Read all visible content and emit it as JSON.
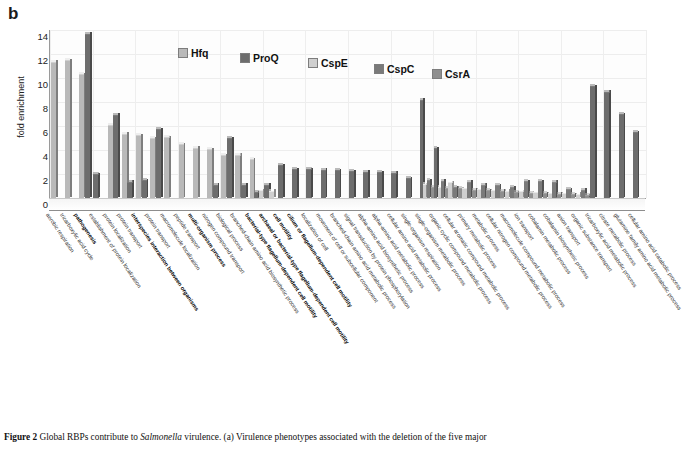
{
  "panel": {
    "letter": "b"
  },
  "legend": {
    "items": [
      {
        "label": "Hfq",
        "color": "#b9b9b9"
      },
      {
        "label": "ProQ",
        "color": "#6d6d6d"
      },
      {
        "label": "CspE",
        "color": "#cfcfcf"
      },
      {
        "label": "CspC",
        "color": "#7a7a7a"
      },
      {
        "label": "CsrA",
        "color": "#8f8f8f"
      }
    ]
  },
  "caption": {
    "figure_number": "Figure 2",
    "text_before_italic": "Global RBPs contribute to ",
    "italic": "Salmonella",
    "text_after_italic": " virulence. (a) Virulence phenotypes associated with the deletion of the five major"
  },
  "chart_data": {
    "type": "bar",
    "title": "",
    "xlabel": "",
    "ylabel": "fold enrichment",
    "ylim": [
      0,
      14
    ],
    "yticks": [
      0,
      2,
      4,
      6,
      8,
      10,
      12,
      14
    ],
    "grid": true,
    "legend_position": "top-center",
    "series_names": [
      "Hfq",
      "ProQ",
      "CspE",
      "CspC",
      "CsrA"
    ],
    "categories": [
      "aerobic respiration",
      "tricarboxylic acid cycle",
      "pathogenesis",
      "establishment of protein localization",
      "protein localization",
      "protein transport",
      "interspecies interaction between organisms",
      "protein transport",
      "macromolecule localization",
      "peptide transport",
      "multi-organism process",
      "nitrogen compound transport",
      "biological process",
      "branched-chain amino acid biosynthetic process",
      "bacterial-type flagellum-dependent cell motility",
      "archaeal or bacterial-type flagellum-dependent cell motility",
      "cell motility",
      "cilium or flagellum-dependent cell motility",
      "localization of cell",
      "movement of cell or subcellular component",
      "branched-chain amino acid metabolic process",
      "signal transduction by protein phosphorylation",
      "alpha-amino acid biosynthetic process",
      "alpha-amino acid metabolic process",
      "cellular amino acid metabolic process",
      "single-organism respiration",
      "single-organism metabolic process",
      "organic cyclic compound metabolic process",
      "cellular aromatic compound metabolic process",
      "primary metabolic process",
      "metabolic process",
      "cellular nitrogen compound metabolic process",
      "macromolecule compound metabolic process",
      "ion transport",
      "cobalamin metabolic process",
      "cobalamin biosynthetic process",
      "anion transport",
      "organic substance transport",
      "tricarboxylic acid metabolic process",
      "citrate metabolic process",
      "glutamine family amino acid metabolic process",
      "cellular amino acid catabolic process"
    ],
    "bold_categories": [
      "pathogenesis",
      "interspecies interaction between organisms",
      "multi-organism process",
      "bacterial-type flagellum-dependent cell motility",
      "archaeal or bacterial-type flagellum-dependent cell motility",
      "cell motility",
      "cilium or flagellum-dependent cell motility"
    ],
    "series": [
      {
        "name": "Hfq",
        "color": "#b9b9b9",
        "values": [
          11.35,
          11.5,
          10.3,
          0,
          6.1,
          5.35,
          5.25,
          5.0,
          5.05,
          4.5,
          4.2,
          4.05,
          3.55,
          3.6,
          3.25,
          0,
          0,
          0,
          0,
          0,
          0,
          0,
          0,
          0,
          0,
          0,
          0,
          0,
          0,
          0,
          0,
          0,
          0,
          0,
          0,
          0,
          0,
          0,
          0,
          0,
          0,
          0
        ]
      },
      {
        "name": "ProQ",
        "color": "#6d6d6d",
        "values": [
          0,
          0,
          13.7,
          2.0,
          6.95,
          1.35,
          1.5,
          5.75,
          0,
          0,
          0,
          1.1,
          5.0,
          1.1,
          0.5,
          1.1,
          2.75,
          2.4,
          2.4,
          2.35,
          2.3,
          2.25,
          2.2,
          2.15,
          2.1,
          1.65,
          8.2,
          4.15,
          0,
          0,
          0,
          0,
          0,
          0,
          0,
          0,
          0,
          0,
          9.3,
          8.85,
          7.0,
          5.5
        ]
      },
      {
        "name": "CspE",
        "color": "#cfcfcf",
        "values": [
          0,
          0,
          0,
          0,
          0,
          0,
          0,
          0,
          0,
          0,
          0,
          0,
          0,
          0,
          0.65,
          0.6,
          0,
          0,
          0,
          0,
          0,
          0,
          0,
          0,
          0,
          0,
          1.15,
          0.95,
          1.3,
          0.85,
          0.75,
          0.7,
          0.6,
          0.55,
          0.5,
          0.45,
          0.4,
          0.35,
          0,
          0,
          0,
          0
        ]
      },
      {
        "name": "CspC",
        "color": "#7a7a7a",
        "values": [
          0,
          0,
          0,
          0,
          0,
          0,
          0,
          0,
          0,
          0,
          0,
          0,
          0,
          0,
          0,
          0,
          0,
          0,
          0,
          0,
          0,
          0,
          0,
          0,
          0,
          0,
          1.5,
          1.45,
          0.9,
          1.35,
          1.1,
          1.05,
          0.9,
          1.4,
          1.4,
          1.35,
          0.75,
          0.7,
          0,
          0,
          0,
          0
        ]
      },
      {
        "name": "CsrA",
        "color": "#8f8f8f",
        "values": [
          0,
          0,
          0,
          0,
          0,
          0,
          0,
          0,
          0,
          0,
          0,
          0,
          0,
          0,
          0,
          0,
          0,
          0,
          0,
          0,
          0,
          0,
          0,
          0,
          0,
          0,
          0.9,
          0.85,
          0.8,
          0.7,
          0.65,
          0.6,
          0.5,
          0.45,
          0.4,
          0.35,
          0.3,
          0.25,
          0,
          0,
          0,
          0
        ]
      }
    ]
  }
}
